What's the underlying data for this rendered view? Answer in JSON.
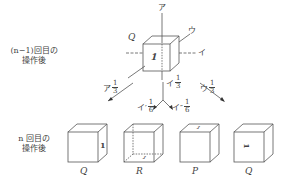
{
  "diagram": {
    "row_labels": {
      "before": {
        "line1": "(n−1)回目の",
        "line2": "操作後"
      },
      "after": {
        "line1": "n 回目の",
        "line2": "操作後"
      }
    },
    "top_cube": {
      "label": "Q",
      "face_mark": "1",
      "axes": {
        "vertical": "ア",
        "horizontal": "イ",
        "depth": "ウ"
      }
    },
    "operations": [
      {
        "axis": "ア",
        "num": "1",
        "den": "3"
      },
      {
        "axis": "イ",
        "num": "1",
        "den": "3"
      },
      {
        "axis": "イ′",
        "num": "1",
        "den": "6"
      },
      {
        "axis": "イ″",
        "num": "1",
        "den": "6"
      },
      {
        "axis": "ウ",
        "num": "1",
        "den": "3"
      }
    ],
    "bottom_cubes": [
      {
        "label": "Q",
        "face_mark": "1"
      },
      {
        "label": "R",
        "face_mark": "1"
      },
      {
        "label": "P",
        "face_mark": "1"
      },
      {
        "label": "Q",
        "face_mark": "1"
      }
    ]
  }
}
